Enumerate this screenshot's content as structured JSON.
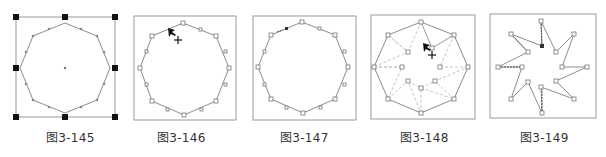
{
  "figures": [
    {
      "id": "fig-145",
      "caption": "图3-145",
      "description": "Octagon selected with bounding box handles and center point"
    },
    {
      "id": "fig-146",
      "caption": "图3-146",
      "description": "Octagon with anchor points, cursor near top-left edge"
    },
    {
      "id": "fig-147",
      "caption": "图3-147",
      "description": "Octagon with added anchor point on top-left edge"
    },
    {
      "id": "fig-148",
      "caption": "图3-148",
      "description": "Octagon with inner dashed star guides, dragging anchor toward center"
    },
    {
      "id": "fig-149",
      "caption": "图3-149",
      "description": "Resulting eight-pointed star shape"
    }
  ],
  "colors": {
    "frame": "#9a9a9a",
    "path": "#8c8c8c",
    "dashed": "#bdbdbd",
    "handle": "#111111",
    "caption": "#333333"
  }
}
